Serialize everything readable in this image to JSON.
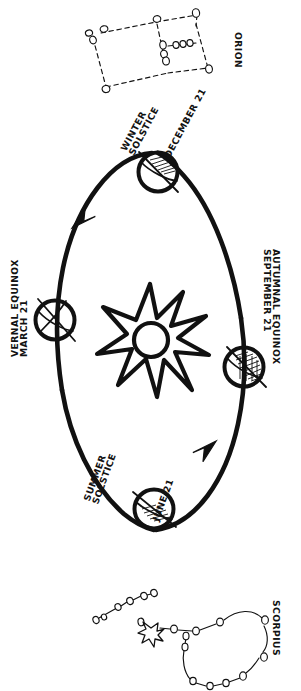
{
  "diagram": {
    "style": "hand-drawn sketch, black ink on white",
    "ink_color": "#111111",
    "background_color": "#ffffff"
  },
  "sun": {
    "name": "sun-starburst",
    "center": [
      150,
      340
    ],
    "core_radius": 17,
    "ray_count": 8
  },
  "orbit": {
    "shape": "ellipse",
    "center": [
      150,
      340
    ],
    "rx": 92,
    "ry": 175,
    "direction": "counterclockwise",
    "arrows": [
      {
        "name": "orbit-arrow-left",
        "at": [
          78,
          210
        ],
        "points": "down-left"
      },
      {
        "name": "orbit-arrow-right",
        "at": [
          212,
          455
        ],
        "points": "up-right"
      }
    ]
  },
  "earth_positions": [
    {
      "id": "winter-solstice",
      "label_line1": "WINTER",
      "label_line2": "SOLSTICE",
      "date": "DECEMBER 21",
      "x": 158,
      "y": 172,
      "r": 20,
      "axis_tilt_deg": 23.5,
      "shading": "northern-hemisphere-away-from-sun"
    },
    {
      "id": "vernal-equinox",
      "label_line1": "VERNAL",
      "label_line2": "EQUINOX",
      "date": "MARCH 21",
      "x": 55,
      "y": 320,
      "r": 20,
      "axis_tilt_deg": 23.5,
      "shading": "equal-illumination"
    },
    {
      "id": "summer-solstice",
      "label_line1": "SUMMER",
      "label_line2": "SOLSTICE",
      "date": "JUNE 21",
      "x": 154,
      "y": 509,
      "r": 20,
      "axis_tilt_deg": 23.5,
      "shading": "northern-hemisphere-toward-sun"
    },
    {
      "id": "autumnal-equinox",
      "label_line1": "AUTUMNAL",
      "label_line2": "EQUINOX",
      "date": "SEPTEMBER 21",
      "x": 244,
      "y": 367,
      "r": 20,
      "axis_tilt_deg": 23.5,
      "shading": "equal-illumination"
    }
  ],
  "constellations": [
    {
      "id": "orion",
      "label": "ORION",
      "position": "top",
      "note": "visible at night during winter",
      "star_count": 11,
      "line_style": "dashed"
    },
    {
      "id": "scorpius",
      "label": "SCORPIUS",
      "position": "bottom",
      "note": "visible at night during summer; bright star drawn as starburst",
      "star_count": 17,
      "line_style": "solid",
      "has_bright_star": true
    }
  ],
  "labels": {
    "winter_solstice_l1": "WINTER",
    "winter_solstice_l2": "SOLSTICE",
    "winter_solstice_date": "DECEMBER 21",
    "vernal_equinox_l1": "VERNAL EQUINOX",
    "vernal_equinox_l2": "MARCH 21",
    "summer_solstice_l1": "SUMMER",
    "summer_solstice_l2": "SOLSTICE",
    "summer_solstice_date": "JUNE 21",
    "autumnal_equinox_l1": "AUTUMNAL EQUINOX",
    "autumnal_equinox_l2": "SEPTEMBER 21",
    "orion": "ORION",
    "scorpius": "SCORPIUS"
  }
}
